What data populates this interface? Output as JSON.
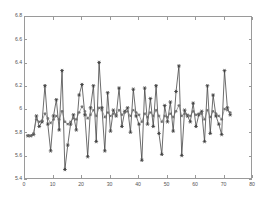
{
  "figure": {
    "background": "#ffffff",
    "frame_color": "#9a9a9a",
    "tick_label_color": "#555555"
  },
  "chart_data": {
    "type": "line",
    "title": "",
    "subtitle": "",
    "xlabel": "",
    "ylabel": "",
    "xlim": [
      0,
      80
    ],
    "ylim": [
      5.4,
      6.8
    ],
    "xticks": [
      0,
      10,
      20,
      30,
      40,
      50,
      60,
      70,
      80
    ],
    "xticklabels": [
      "0",
      "10",
      "20",
      "30",
      "40",
      "50",
      "60",
      "70",
      "80"
    ],
    "yticks": [
      5.4,
      5.6,
      5.8,
      6.0,
      6.2,
      6.4,
      6.6,
      6.8
    ],
    "yticklabels": [
      "5.4",
      "5.6",
      "5.8",
      "6",
      "6.2",
      "6.4",
      "6.6",
      "6.8"
    ],
    "grid": false,
    "legend": null,
    "legend_position": "none",
    "marker": "star",
    "line_color": "#3c3c3c",
    "marker_color": "#1a1a1a",
    "series": [
      {
        "name": "noisy-signal",
        "style": "line-with-star-markers",
        "color": "#3c3c3c",
        "x": [
          1,
          2,
          3,
          4,
          5,
          6,
          7,
          8,
          9,
          10,
          11,
          12,
          13,
          14,
          15,
          16,
          17,
          18,
          19,
          20,
          21,
          22,
          23,
          24,
          25,
          26,
          27,
          28,
          29,
          30,
          31,
          32,
          33,
          34,
          35,
          36,
          37,
          38,
          39,
          40,
          41,
          42,
          43,
          44,
          45,
          46,
          47,
          48,
          49,
          50,
          51,
          52,
          53,
          54,
          55,
          56,
          57,
          58,
          59,
          60,
          61,
          62,
          63,
          64,
          65,
          66,
          67,
          68,
          69,
          70,
          71,
          72
        ],
        "values": [
          5.78,
          5.78,
          5.79,
          5.95,
          5.86,
          5.9,
          6.21,
          5.88,
          5.65,
          5.95,
          6.09,
          5.83,
          6.34,
          5.49,
          5.7,
          5.88,
          5.96,
          5.83,
          6.13,
          6.22,
          5.96,
          5.6,
          6.02,
          6.21,
          5.73,
          6.41,
          6.02,
          5.65,
          6.15,
          5.82,
          6.0,
          5.95,
          6.19,
          5.86,
          5.99,
          6.02,
          5.81,
          6.18,
          5.95,
          5.88,
          5.57,
          6.19,
          5.88,
          6.1,
          5.86,
          6.21,
          5.8,
          5.62,
          6.04,
          5.9,
          6.07,
          5.82,
          6.16,
          6.38,
          5.61,
          6.0,
          5.95,
          5.9,
          6.06,
          5.86,
          5.96,
          5.99,
          5.73,
          6.21,
          5.8,
          6.13,
          5.95,
          5.88,
          5.79,
          6.34,
          6.02,
          5.96
        ]
      },
      {
        "name": "smoothed-estimate",
        "style": "line-with-star-markers",
        "color": "#6a6a6a",
        "x": [
          1,
          2,
          3,
          4,
          5,
          6,
          7,
          8,
          9,
          10,
          11,
          12,
          13,
          14,
          15,
          16,
          17,
          18,
          19,
          20,
          21,
          22,
          23,
          24,
          25,
          26,
          27,
          28,
          29,
          30,
          31,
          32,
          33,
          34,
          35,
          36,
          37,
          38,
          39,
          40,
          41,
          42,
          43,
          44,
          45,
          46,
          47,
          48,
          49,
          50,
          51,
          52,
          53,
          54,
          55,
          56,
          57,
          58,
          59,
          60,
          61,
          62,
          63,
          64,
          65,
          66,
          67,
          68,
          69,
          70,
          71,
          72
        ],
        "values": [
          5.78,
          5.78,
          5.8,
          5.92,
          5.9,
          5.91,
          5.97,
          5.93,
          5.89,
          5.92,
          5.95,
          5.92,
          5.99,
          5.9,
          5.88,
          5.9,
          5.93,
          5.92,
          5.98,
          6.03,
          5.99,
          5.93,
          5.96,
          6.0,
          5.95,
          6.02,
          6.0,
          5.94,
          5.98,
          5.95,
          5.97,
          5.96,
          6.0,
          5.96,
          5.98,
          5.99,
          5.95,
          6.0,
          5.98,
          5.96,
          5.9,
          5.97,
          5.94,
          5.98,
          5.95,
          6.0,
          5.95,
          5.9,
          5.95,
          5.94,
          5.97,
          5.94,
          5.99,
          6.04,
          5.95,
          5.97,
          5.96,
          5.95,
          5.99,
          5.96,
          5.97,
          5.97,
          5.92,
          6.0,
          5.94,
          5.99,
          5.97,
          5.95,
          5.92,
          6.01,
          6.0,
          5.98
        ]
      }
    ]
  }
}
